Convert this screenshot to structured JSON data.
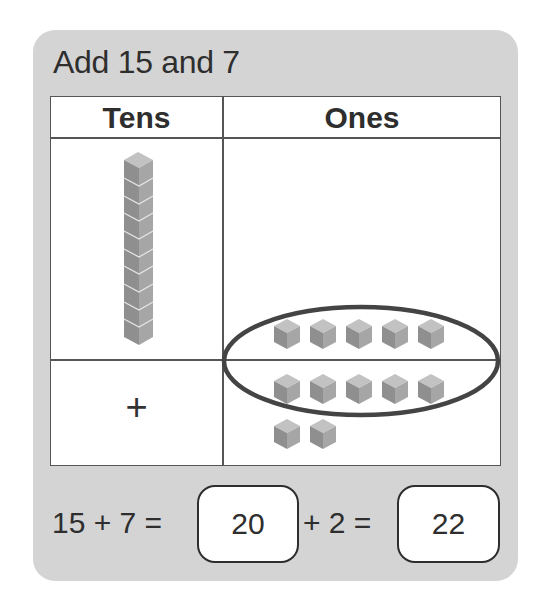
{
  "title": "Add 15 and 7",
  "table": {
    "headers": [
      "Tens",
      "Ones"
    ],
    "rows": [
      {
        "tens": {
          "rods": 1,
          "units_per_rod": 10
        },
        "ones": {
          "cubes": 5
        }
      },
      {
        "tens": {
          "symbol": "+"
        },
        "ones": {
          "cubes": 7
        }
      }
    ],
    "grouping": {
      "shape": "ellipse",
      "description": "circles 10 ones (5 from top row + 5 from bottom row)"
    }
  },
  "equation": {
    "part1": "15 + 7 =",
    "answer1": "20",
    "part2": "+ 2 =",
    "answer2": "22"
  },
  "colors": {
    "card": "#d4d4d4",
    "cell": "#ffffff",
    "line": "#555555",
    "cube_top": "#c2c2c2",
    "cube_left": "#8f8f8f",
    "cube_right": "#a6a6a6",
    "ellipse": "#444444"
  }
}
